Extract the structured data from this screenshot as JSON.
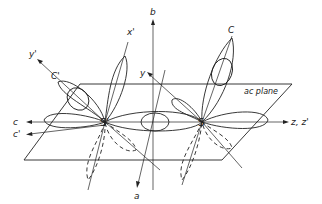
{
  "diagram": {
    "colors": {
      "line": "#222222",
      "background": "#ffffff"
    },
    "axes": {
      "b": "b",
      "x_prime": "x'",
      "y_prime": "y'",
      "y": "y",
      "c": "c",
      "c_prime": "c'",
      "z_zprime": "z, z'",
      "a": "a"
    },
    "atoms": {
      "s_prime": "S'",
      "s": "S"
    },
    "bond_labels": {
      "c_prime_atom": "C'",
      "c_atom": "C"
    },
    "plane_label": "ac plane"
  }
}
